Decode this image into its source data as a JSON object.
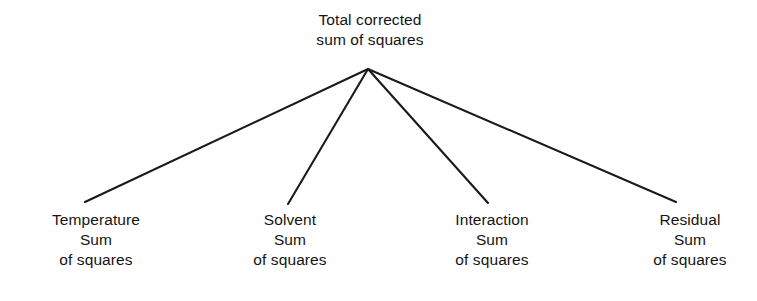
{
  "diagram": {
    "type": "tree",
    "title_node": {
      "id": "total-corrected-sum-of-squares",
      "lines": [
        "Total corrected",
        "sum of squares"
      ],
      "center_x": 370,
      "top_y": 10
    },
    "children": [
      {
        "id": "temperature-sum-of-squares",
        "lines": [
          "Temperature",
          "Sum",
          "of squares"
        ],
        "center_x": 96,
        "top_y": 210,
        "line_end_x": 85,
        "line_end_y": 202
      },
      {
        "id": "solvent-sum-of-squares",
        "lines": [
          "Solvent",
          "Sum",
          "of squares"
        ],
        "center_x": 290,
        "top_y": 210,
        "line_end_x": 288,
        "line_end_y": 204
      },
      {
        "id": "interaction-sum-of-squares",
        "lines": [
          "Interaction",
          "Sum",
          "of squares"
        ],
        "center_x": 492,
        "top_y": 210,
        "line_end_x": 488,
        "line_end_y": 203
      },
      {
        "id": "residual-sum-of-squares",
        "lines": [
          "Residual",
          "Sum",
          "of squares"
        ],
        "center_x": 690,
        "top_y": 210,
        "line_end_x": 676,
        "line_end_y": 202
      }
    ],
    "apex": {
      "x": 368,
      "y": 69
    },
    "colors": {
      "background": "#ffffff",
      "text": "#141414",
      "connector": "#1a1a1a"
    },
    "connector_width": 2.1
  }
}
